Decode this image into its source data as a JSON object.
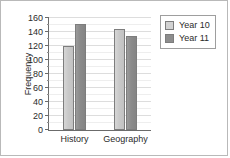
{
  "chart_data": {
    "type": "bar",
    "title": "",
    "xlabel": "",
    "ylabel": "Frequency",
    "categories": [
      "History",
      "Geography"
    ],
    "series": [
      {
        "name": "Year 10",
        "values": [
          120,
          145
        ],
        "color": "#d2d2d2"
      },
      {
        "name": "Year 11",
        "values": [
          152,
          135
        ],
        "color": "#8d8d8d"
      }
    ],
    "ylim": [
      0,
      160
    ],
    "ytick_step": 20,
    "yticks": [
      0,
      20,
      40,
      60,
      80,
      100,
      120,
      140,
      160
    ],
    "ytick_labels": [
      "0",
      "20",
      "40",
      "60",
      "80",
      "100",
      "120",
      "140",
      "160"
    ],
    "minor_ytick_step": 10,
    "grid": true,
    "grid_axis": "y",
    "legend_position": "right",
    "legend_entries": [
      "Year 10",
      "Year 11"
    ]
  }
}
